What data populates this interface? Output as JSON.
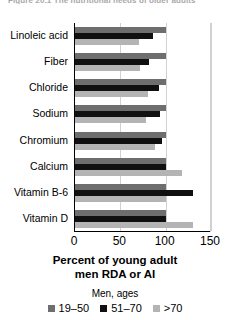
{
  "caption_fragment": "Figure 20.1  The nutritional needs of older adults",
  "chart_data": {
    "type": "bar",
    "orientation": "horizontal",
    "title": "",
    "xlabel": "Percent of young adult men RDA or AI",
    "ylabel": "",
    "xlim": [
      0,
      150
    ],
    "xticks": [
      0,
      50,
      100,
      150
    ],
    "grid": true,
    "grid_axis": "x",
    "legend_title": "Men, ages",
    "legend_position": "bottom",
    "categories": [
      "Linoleic acid",
      "Fiber",
      "Chloride",
      "Sodium",
      "Chromium",
      "Calcium",
      "Vitamin B-6",
      "Vitamin D"
    ],
    "series": [
      {
        "name": "19–50",
        "color": "#6e6e6e",
        "values": [
          100,
          100,
          100,
          100,
          100,
          100,
          100,
          100
        ]
      },
      {
        "name": "51–70",
        "color": "#101010",
        "values": [
          86,
          82,
          93,
          94,
          96,
          100,
          130,
          100
        ]
      },
      {
        "name": ">70",
        "color": "#b4b4b4",
        "values": [
          71,
          72,
          80,
          78,
          88,
          118,
          100,
          130
        ]
      }
    ]
  },
  "axis": {
    "x_tick_labels": [
      "0",
      "50",
      "100",
      "150"
    ],
    "x_title_line1": "Percent of young adult",
    "x_title_line2": "men RDA or AI"
  },
  "legend": {
    "title": "Men, ages",
    "items": [
      {
        "label": "19–50",
        "color": "#6e6e6e"
      },
      {
        "label": "51–70",
        "color": "#101010"
      },
      {
        "label": ">70",
        "color": "#b4b4b4"
      }
    ]
  }
}
